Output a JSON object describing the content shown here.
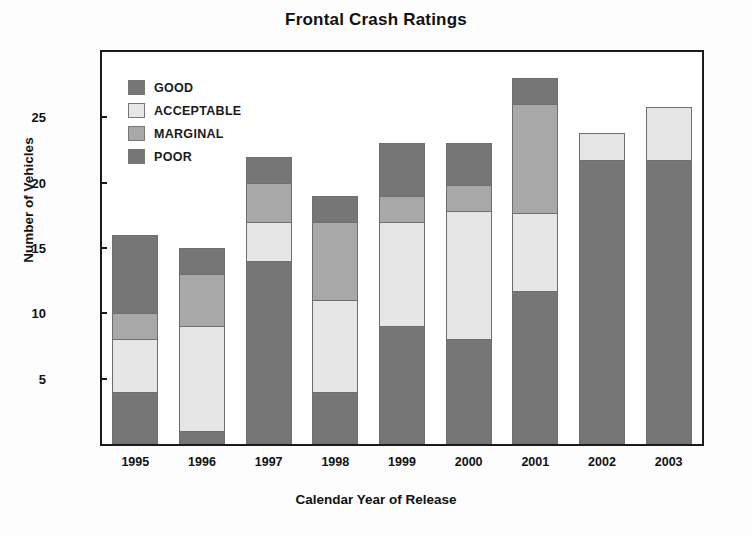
{
  "chart_data": {
    "type": "bar",
    "stacked": true,
    "title": "Frontal Crash Ratings",
    "xlabel": "Calendar Year of Release",
    "ylabel": "Number of Vehicles",
    "categories": [
      "1995",
      "1996",
      "1997",
      "1998",
      "1999",
      "2000",
      "2001",
      "2002",
      "2003"
    ],
    "ylim": [
      0,
      30
    ],
    "yticks": [
      5,
      10,
      15,
      20,
      25
    ],
    "grid": false,
    "legend_position": "top-left inside plot",
    "stack_order_bottom_to_top": [
      "GOOD",
      "ACCEPTABLE",
      "MARGINAL",
      "POOR"
    ],
    "series": [
      {
        "name": "GOOD",
        "color": "#767676",
        "values": [
          4,
          1,
          14,
          4,
          9,
          8,
          11.7,
          21.7,
          21.7
        ]
      },
      {
        "name": "ACCEPTABLE",
        "color": "#e6e6e6",
        "values": [
          4,
          8,
          3,
          7,
          8,
          9.8,
          6,
          2.1,
          4.1
        ]
      },
      {
        "name": "MARGINAL",
        "color": "#a8a8a8",
        "values": [
          2,
          4,
          3,
          6,
          2,
          2,
          8.3,
          0,
          0
        ]
      },
      {
        "name": "POOR",
        "color": "#767676",
        "values": [
          6,
          2,
          2,
          2,
          4,
          3.2,
          2,
          0,
          0
        ]
      }
    ],
    "totals": [
      16,
      15,
      22,
      19,
      23,
      23,
      28,
      23.8,
      25.8
    ]
  },
  "legend": {
    "items": [
      {
        "label": "GOOD",
        "color": "#767676"
      },
      {
        "label": "ACCEPTABLE",
        "color": "#e6e6e6"
      },
      {
        "label": "MARGINAL",
        "color": "#a8a8a8"
      },
      {
        "label": "POOR",
        "color": "#767676"
      }
    ]
  },
  "axis": {
    "y_tick_labels": [
      "25",
      "20",
      "15",
      "10",
      "5"
    ],
    "x_tick_labels": [
      "1995",
      "1996",
      "1997",
      "1998",
      "1999",
      "2000",
      "2001",
      "2002",
      "2003"
    ]
  },
  "colors": {
    "frame": "#1b1b1b",
    "background": "#ffffff",
    "segment_outline": "#6e6e6e",
    "text": "#111111"
  }
}
